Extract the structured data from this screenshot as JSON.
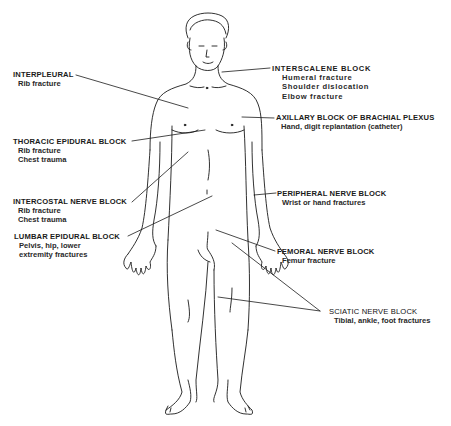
{
  "diagram": {
    "stroke_color": "#1a1a1a",
    "background": "#ffffff"
  },
  "labels": {
    "interpleural": {
      "title": "INTERPLEURAL",
      "lines": [
        "Rib fracture"
      ]
    },
    "thoracic_epidural": {
      "title": "THORACIC EPIDURAL BLOCK",
      "lines": [
        "Rib fracture",
        "Chest trauma"
      ]
    },
    "intercostal": {
      "title": "INTERCOSTAL NERVE BLOCK",
      "lines": [
        "Rib fracture",
        "Chest trauma"
      ]
    },
    "lumbar_epidural": {
      "title": "LUMBAR EPIDURAL BLOCK",
      "lines": [
        "Pelvis, hip, lower",
        "extremity fractures"
      ]
    },
    "interscalene": {
      "title": "INTERSCALENE  BLOCK",
      "lines": [
        "Humeral  fracture",
        "Shoulder  dislocation",
        "Elbow  fracture"
      ]
    },
    "axillary": {
      "title": "AXILLARY BLOCK OF BRACHIAL PLEXUS",
      "lines": [
        "Hand, digit replantation (catheter)"
      ]
    },
    "peripheral": {
      "title": "PERIPHERAL NERVE BLOCK",
      "lines": [
        "Wrist or hand fractures"
      ]
    },
    "femoral": {
      "title": "FEMORAL NERVE BLOCK",
      "lines": [
        "Femur fracture"
      ]
    },
    "sciatic": {
      "title": "SCIATIC NERVE BLOCK",
      "lines": [
        "Tibial, ankle, foot fractures"
      ]
    }
  }
}
